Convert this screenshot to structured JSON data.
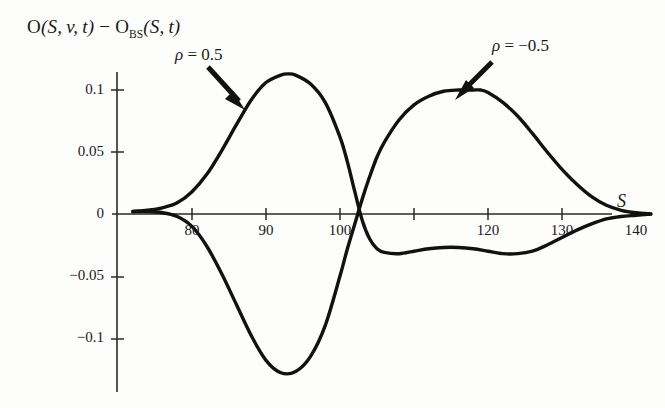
{
  "figure": {
    "background_color": "#fdfdfb",
    "ink_color": "#111111",
    "axis_color": "#2a2a2a"
  },
  "axis_title": {
    "prefix": "O",
    "full": "O(S, v, t) − O",
    "subscript": "BS",
    "suffix": "(S, t)"
  },
  "xaxis_name": "S",
  "annotations": [
    {
      "name": "rho-positive",
      "symbol": "ρ",
      "equals": " = ",
      "value": "0.5"
    },
    {
      "name": "rho-negative",
      "symbol": "ρ",
      "equals": " = ",
      "value": "−0.5"
    }
  ],
  "chart_data": {
    "type": "line",
    "xlabel": "S",
    "ylabel": "O(S,v,t) - O_BS(S,t)",
    "xlim": [
      72,
      143
    ],
    "ylim": [
      -0.14,
      0.125
    ],
    "grid": false,
    "legend": "annotated-arrows",
    "xticks": [
      80,
      90,
      100,
      110,
      120,
      130,
      140
    ],
    "xtick_labels": [
      "80",
      "90",
      "100",
      "",
      "120",
      "130",
      "140"
    ],
    "yticks": [
      0.1,
      0.05,
      0,
      -0.05,
      -0.1
    ],
    "ytick_labels": [
      "0.1",
      "0.05",
      "0",
      "−0.05",
      "−0.1"
    ],
    "series": [
      {
        "name": "ρ = 0.5",
        "color": "#111111",
        "x": [
          72,
          74,
          76,
          78,
          80,
          82,
          84,
          86,
          88,
          90,
          92,
          93,
          94,
          96,
          98,
          100,
          101,
          102,
          103,
          104,
          105,
          106,
          108,
          110,
          112,
          114,
          116,
          118,
          120,
          122,
          124,
          126,
          128,
          130,
          132,
          134,
          136,
          138,
          140,
          142
        ],
        "y": [
          0.002,
          0.003,
          0.005,
          0.009,
          0.018,
          0.032,
          0.051,
          0.072,
          0.092,
          0.106,
          0.112,
          0.113,
          0.112,
          0.105,
          0.09,
          0.062,
          0.042,
          0.018,
          -0.005,
          -0.02,
          -0.028,
          -0.031,
          -0.032,
          -0.03,
          -0.028,
          -0.027,
          -0.027,
          -0.028,
          -0.03,
          -0.032,
          -0.032,
          -0.03,
          -0.025,
          -0.019,
          -0.013,
          -0.008,
          -0.004,
          -0.002,
          -0.001,
          0.0
        ]
      },
      {
        "name": "ρ = −0.5",
        "color": "#111111",
        "x": [
          72,
          74,
          76,
          78,
          80,
          82,
          84,
          86,
          88,
          90,
          92,
          94,
          96,
          98,
          100,
          101,
          102,
          103,
          104,
          105,
          106,
          108,
          110,
          112,
          114,
          116,
          118,
          119,
          120,
          122,
          124,
          126,
          128,
          130,
          132,
          134,
          136,
          138,
          140,
          142
        ],
        "y": [
          0.002,
          0.002,
          0.001,
          -0.002,
          -0.01,
          -0.026,
          -0.048,
          -0.073,
          -0.098,
          -0.118,
          -0.128,
          -0.127,
          -0.115,
          -0.09,
          -0.05,
          -0.028,
          -0.008,
          0.012,
          0.03,
          0.046,
          0.058,
          0.076,
          0.088,
          0.095,
          0.099,
          0.1,
          0.1,
          0.1,
          0.098,
          0.09,
          0.079,
          0.065,
          0.05,
          0.036,
          0.024,
          0.014,
          0.007,
          0.003,
          0.001,
          0.0
        ]
      },
      {
        "name": "lower-mirror-left",
        "color": "#111111",
        "x": [
          100,
          101,
          102,
          103,
          104,
          105,
          106,
          107,
          108,
          110,
          112,
          114,
          116,
          118,
          120
        ],
        "y": [
          -0.05,
          -0.075,
          -0.1,
          -0.118,
          -0.113,
          -0.1,
          -0.085,
          -0.095,
          -0.108,
          -0.113,
          -0.108,
          -0.095,
          -0.08,
          -0.062,
          -0.045
        ]
      }
    ]
  }
}
